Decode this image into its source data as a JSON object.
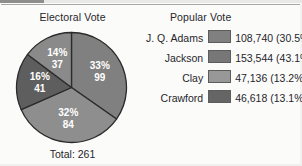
{
  "electoral": {
    "title": "Electoral Vote",
    "total_label": "Total: 261",
    "total": 261
  },
  "popular": {
    "title": "Popular Vote",
    "rows": [
      {
        "name": "J. Q. Adams",
        "value": "108,740 (30.5%)",
        "swatch": "#808080",
        "swatch_name": "legend-swatch-adams"
      },
      {
        "name": "Jackson",
        "value": "153,544 (43.1%)",
        "swatch": "#777777",
        "swatch_name": "legend-swatch-jackson"
      },
      {
        "name": "Clay",
        "value": "47,136 (13.2%)",
        "swatch": "#989898",
        "swatch_name": "legend-swatch-clay"
      },
      {
        "name": "Crawford",
        "value": "46,618 (13.1%)",
        "swatch": "#656565",
        "swatch_name": "legend-swatch-crawford"
      }
    ]
  },
  "chart_data": {
    "type": "pie",
    "title": "Electoral Vote",
    "total": 261,
    "total_label": "Total: 261",
    "start_angle_deg": 0,
    "direction": "clockwise",
    "categories": [
      "Jackson",
      "Adams",
      "Crawford",
      "Clay"
    ],
    "values": [
      99,
      84,
      41,
      37
    ],
    "percents": [
      33,
      32,
      16,
      14
    ],
    "slices": [
      {
        "label_pct": "33%",
        "label_val": "99",
        "value": 99,
        "percent": 33,
        "color": "#808080",
        "name": "pie-slice-jackson"
      },
      {
        "label_pct": "32%",
        "label_val": "84",
        "value": 84,
        "percent": 32,
        "color": "#8e8e8e",
        "name": "pie-slice-adams"
      },
      {
        "label_pct": "16%",
        "label_val": "41",
        "value": 41,
        "percent": 16,
        "color": "#5e5e5e",
        "name": "pie-slice-crawford"
      },
      {
        "label_pct": "14%",
        "label_val": "37",
        "value": 37,
        "percent": 14,
        "color": "#8a8a8a",
        "name": "pie-slice-clay"
      }
    ],
    "legend_position": "right",
    "grid": false,
    "companion_table": {
      "type": "table",
      "title": "Popular Vote",
      "columns": [
        "Candidate",
        "Popular Votes"
      ],
      "rows": [
        [
          "J. Q. Adams",
          "108,740 (30.5%)"
        ],
        [
          "Jackson",
          "153,544 (43.1%)"
        ],
        [
          "Clay",
          "47,136 (13.2%)"
        ],
        [
          "Crawford",
          "46,618 (13.1%)"
        ]
      ]
    }
  }
}
